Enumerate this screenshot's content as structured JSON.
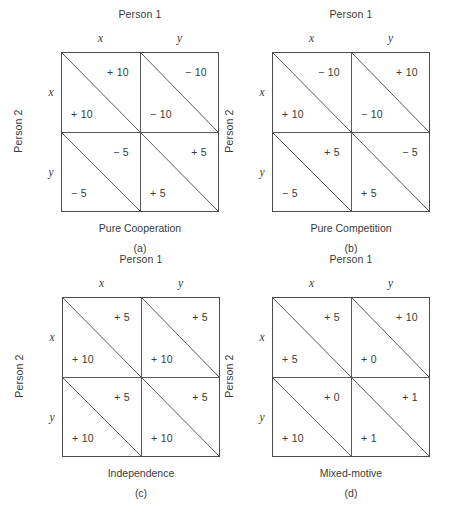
{
  "figure": {
    "title": "",
    "panels": [
      {
        "id": "a",
        "key": "panel_a",
        "column_header": "Person 1",
        "row_header": "Person 2",
        "column_labels": [
          "x",
          "y"
        ],
        "row_labels": [
          "x",
          "y"
        ],
        "caption": "Pure Cooperation",
        "sublabel": "(a)",
        "cells": [
          {
            "row": "x",
            "col": "x",
            "person1": "+ 10",
            "person2": "+ 10"
          },
          {
            "row": "x",
            "col": "y",
            "person1": "− 10",
            "person2": "− 10"
          },
          {
            "row": "y",
            "col": "x",
            "person1": "− 5",
            "person2": "− 5"
          },
          {
            "row": "y",
            "col": "y",
            "person1": "+ 5",
            "person2": "+ 5"
          }
        ]
      },
      {
        "id": "b",
        "key": "panel_b",
        "column_header": "Person 1",
        "row_header": "Person 2",
        "column_labels": [
          "x",
          "y"
        ],
        "row_labels": [
          "x",
          "y"
        ],
        "caption": "Pure Competition",
        "sublabel": "(b)",
        "cells": [
          {
            "row": "x",
            "col": "x",
            "person1": "− 10",
            "person2": "+ 10"
          },
          {
            "row": "x",
            "col": "y",
            "person1": "+ 10",
            "person2": "− 10"
          },
          {
            "row": "y",
            "col": "x",
            "person1": "+ 5",
            "person2": "− 5"
          },
          {
            "row": "y",
            "col": "y",
            "person1": "− 5",
            "person2": "+ 5"
          }
        ]
      },
      {
        "id": "c",
        "key": "panel_c",
        "column_header": "Person 1",
        "row_header": "Person 2",
        "column_labels": [
          "x",
          "y"
        ],
        "row_labels": [
          "x",
          "y"
        ],
        "caption": "Independence",
        "sublabel": "(c)",
        "cells": [
          {
            "row": "x",
            "col": "x",
            "person1": "+ 5",
            "person2": "+ 10"
          },
          {
            "row": "x",
            "col": "y",
            "person1": "+ 5",
            "person2": "+ 10"
          },
          {
            "row": "y",
            "col": "x",
            "person1": "+ 5",
            "person2": "+ 10"
          },
          {
            "row": "y",
            "col": "y",
            "person1": "+ 5",
            "person2": "+ 10"
          }
        ]
      },
      {
        "id": "d",
        "key": "panel_d",
        "column_header": "Person 1",
        "row_header": "Person 2",
        "column_labels": [
          "x",
          "y"
        ],
        "row_labels": [
          "x",
          "y"
        ],
        "caption": "Mixed-motive",
        "sublabel": "(d)",
        "cells": [
          {
            "row": "x",
            "col": "x",
            "person1": "+ 5",
            "person2": "+ 5"
          },
          {
            "row": "x",
            "col": "y",
            "person1": "+ 10",
            "person2": "+ 0"
          },
          {
            "row": "y",
            "col": "x",
            "person1": "+ 0",
            "person2": "+ 10"
          },
          {
            "row": "y",
            "col": "y",
            "person1": "+ 1",
            "person2": "+ 1"
          }
        ]
      }
    ],
    "colors": {
      "background": "#ffffff",
      "ink": "#3a3a3a",
      "border": "#4a4a4a",
      "rule": "#5a5a5a"
    }
  }
}
